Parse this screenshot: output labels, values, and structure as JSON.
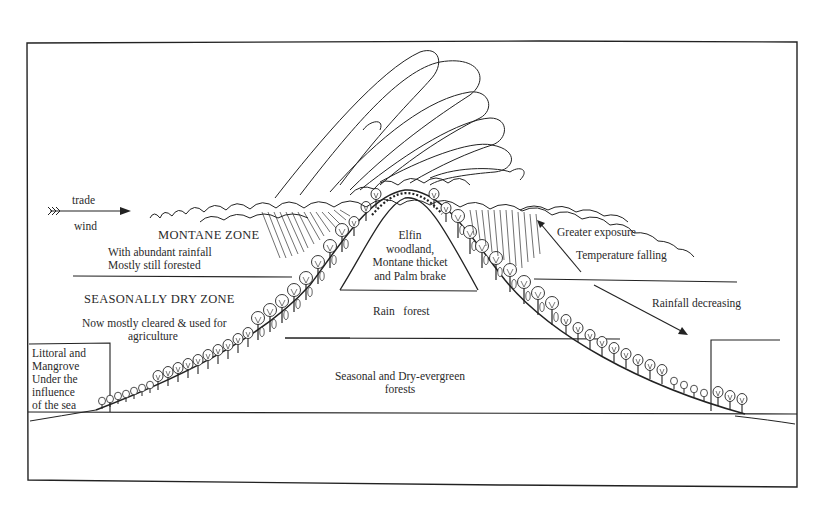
{
  "diagram": {
    "type": "mountain vegetation zonation cross-section",
    "wind": {
      "label_top": "trade",
      "label_bottom": "wind"
    },
    "zones": {
      "montane": {
        "title": "MONTANE ZONE",
        "line1": "With abundant rainfall",
        "line2": "Mostly still forested"
      },
      "seasonally_dry": {
        "title": "SEASONALLY DRY ZONE",
        "line1": "Now mostly cleared & used for",
        "line2": "agriculture"
      },
      "littoral": {
        "text": "Littoral and\nMangrove\nUnder the\ninfluence\nof the sea"
      }
    },
    "mountain_bands": {
      "summit": "Elfin\nwoodland,\nMontane thicket\nand Palm brake",
      "rain_forest": "Rain   forest",
      "lowland": "Seasonal and Dry-evergreen\nforests"
    },
    "annotations": {
      "exposure": "Greater exposure",
      "temperature": "Temperature falling",
      "rainfall": "Rainfall decreasing"
    },
    "colors": {
      "ink": "#222222",
      "background": "#ffffff"
    }
  }
}
